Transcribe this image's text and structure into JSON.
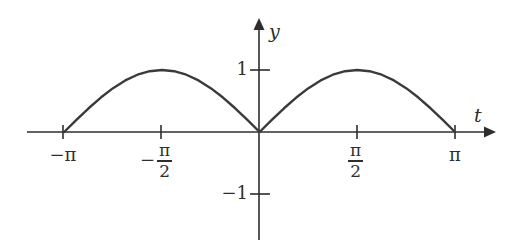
{
  "figure": {
    "background_color": "#ffffff",
    "axis_color": "#2e2e2e",
    "curve_color": "#3a3a3a"
  },
  "axes": {
    "x_axis_label": "t",
    "y_axis_label": "y"
  },
  "x_ticks": [
    {
      "label": "−π",
      "value": -3.14159,
      "type": "plain"
    },
    {
      "label": "−π/2",
      "value": -1.5708,
      "type": "fraction",
      "sign": "−",
      "numerator": "π",
      "denominator": "2"
    },
    {
      "label": "π/2",
      "value": 1.5708,
      "type": "fraction",
      "sign": "",
      "numerator": "π",
      "denominator": "2"
    },
    {
      "label": "π",
      "value": 3.14159,
      "type": "plain"
    }
  ],
  "y_ticks": [
    {
      "label": "1",
      "value": 1
    },
    {
      "label": "−1",
      "value": -1
    }
  ],
  "chart_data": {
    "type": "line",
    "title": "",
    "xlabel": "t",
    "ylabel": "y",
    "function": "y = |sin(t)|",
    "xlim": [
      -3.14159,
      3.14159
    ],
    "ylim": [
      -1,
      1
    ],
    "grid": false,
    "legend": null,
    "xtick_values": [
      -3.14159,
      -1.5708,
      1.5708,
      3.14159
    ],
    "xtick_labels": [
      "−π",
      "−π/2",
      "π/2",
      "π"
    ],
    "ytick_values": [
      1,
      -1
    ],
    "ytick_labels": [
      "1",
      "−1"
    ],
    "series": [
      {
        "name": "|sin(t)|",
        "color": "#3a3a3a",
        "x": [
          -3.14159,
          -2.94524,
          -2.7489,
          -2.55255,
          -2.35619,
          -2.15984,
          -1.9635,
          -1.76715,
          -1.5708,
          -1.37445,
          -1.1781,
          -0.98175,
          -0.7854,
          -0.58905,
          -0.3927,
          -0.19635,
          0.0,
          0.19635,
          0.3927,
          0.58905,
          0.7854,
          0.98175,
          1.1781,
          1.37445,
          1.5708,
          1.76715,
          1.9635,
          2.15984,
          2.35619,
          2.55255,
          2.7489,
          2.94524,
          3.14159
        ],
        "y": [
          0.0,
          0.19509,
          0.38268,
          0.55557,
          0.70711,
          0.83147,
          0.92388,
          0.98079,
          1.0,
          0.98079,
          0.92388,
          0.83147,
          0.70711,
          0.55557,
          0.38268,
          0.19509,
          0.0,
          0.19509,
          0.38268,
          0.55557,
          0.70711,
          0.83147,
          0.92388,
          0.98079,
          1.0,
          0.98079,
          0.92388,
          0.83147,
          0.70711,
          0.55557,
          0.38268,
          0.19509,
          0.0
        ]
      }
    ],
    "annotations": [
      {
        "text": "cusp at origin",
        "x": 0,
        "y": 0
      }
    ]
  }
}
